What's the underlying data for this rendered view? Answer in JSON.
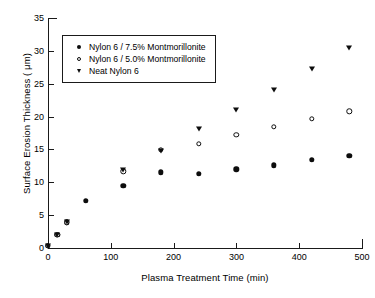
{
  "chart_data": {
    "type": "scatter",
    "title": "",
    "xlabel": "Plasma Treatment Time (min)",
    "ylabel": "Surface Erosion Thickness ( μm)",
    "xlim": [
      0,
      500
    ],
    "ylim": [
      0,
      35
    ],
    "xticks": [
      0,
      100,
      200,
      300,
      400,
      500
    ],
    "yticks": [
      0,
      5,
      10,
      15,
      20,
      25,
      30,
      35
    ],
    "xtick_labels": [
      "0",
      "100",
      "200",
      "300",
      "400",
      "500"
    ],
    "ytick_labels": [
      "0",
      "5",
      "10",
      "15",
      "20",
      "25",
      "30",
      "35"
    ],
    "grid": false,
    "legend_position": "upper left inside",
    "series": [
      {
        "name": "Nylon 6 / 7.5% Montmorillonite",
        "marker": "filled-circle",
        "color": "#0d0d0d",
        "x": [
          0,
          15,
          30,
          60,
          120,
          180,
          240,
          300,
          360,
          420,
          480
        ],
        "y": [
          0.3,
          2.0,
          3.9,
          7.2,
          9.5,
          11.5,
          11.3,
          12.0,
          12.6,
          13.4,
          14.0
        ]
      },
      {
        "name": "Nylon 6 / 5.0% Montmorillonite",
        "marker": "open-circle",
        "color": "#0d0d0d",
        "x": [
          0,
          15,
          30,
          120,
          180,
          240,
          300,
          360,
          420,
          480
        ],
        "y": [
          0.3,
          2.0,
          3.9,
          11.7,
          14.9,
          15.9,
          17.2,
          18.4,
          19.7,
          20.8
        ]
      },
      {
        "name": "Neat Nylon 6",
        "marker": "down-triangle",
        "color": "#0d0d0d",
        "x": [
          0,
          15,
          30,
          120,
          180,
          240,
          300,
          360,
          420,
          480
        ],
        "y": [
          0.3,
          2.0,
          3.9,
          11.8,
          14.7,
          18.1,
          21.0,
          24.1,
          27.3,
          30.4
        ]
      }
    ]
  },
  "legend": {
    "entries": [
      {
        "label": "Nylon 6 / 7.5% Montmorillonite",
        "marker": "filled-circle"
      },
      {
        "label": "Nylon 6 / 5.0% Montmorillonite",
        "marker": "open-circle"
      },
      {
        "label": "Neat Nylon 6",
        "marker": "down-triangle"
      }
    ]
  }
}
